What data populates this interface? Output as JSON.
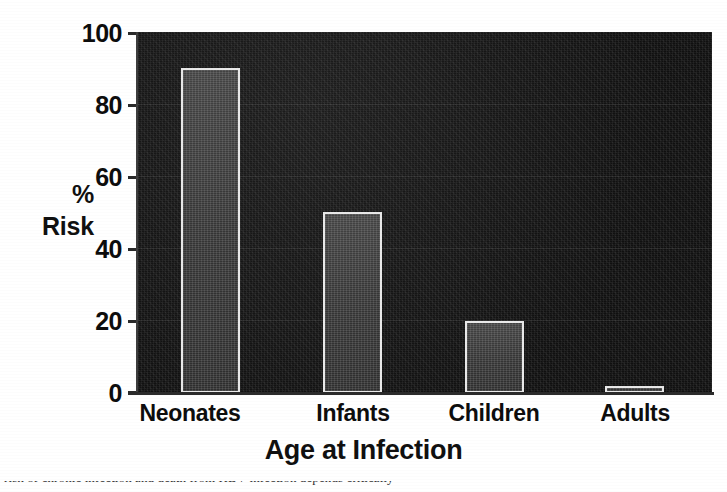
{
  "chart_data": {
    "type": "bar",
    "title": "",
    "subtitle": "",
    "xlabel": "Age at Infection",
    "ylabel_lines": [
      "%",
      "Risk"
    ],
    "ylabel": "% Risk",
    "categories": [
      "Neonates",
      "Infants",
      "Children",
      "Adults"
    ],
    "values": [
      90,
      50,
      20,
      2
    ],
    "ylim": [
      0,
      100
    ],
    "xlim": [
      0,
      4
    ],
    "yticks": [
      0,
      20,
      40,
      60,
      80,
      100
    ],
    "ytick_labels": [
      "0",
      "20",
      "40",
      "60",
      "80",
      "100"
    ],
    "grid": false,
    "legend": null,
    "legend_position": "none",
    "series": [
      {
        "name": "% Risk",
        "values": [
          90,
          50,
          20,
          2
        ]
      }
    ],
    "colors": {
      "plot_background": "#141414",
      "bar_fill": "#3a3a3a",
      "bar_outline": "#e9e9e9",
      "figure_background": "#ffffff",
      "text": "#101010",
      "axis_line": "#2b2b2b"
    }
  },
  "caption": {
    "cropped_line": "risk of chronic infection and death from HBV infection depends critically"
  }
}
